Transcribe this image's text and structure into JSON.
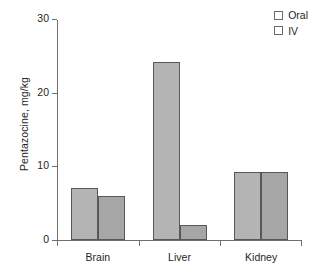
{
  "chart_data": {
    "type": "bar",
    "title": "",
    "subtitle": "",
    "xlabel": "",
    "ylabel": "Pentazocine, mg/kg",
    "categories": [
      "Brain",
      "Liver",
      "Kidney"
    ],
    "series": [
      {
        "name": "Oral",
        "values": [
          7.0,
          24.1,
          9.3
        ],
        "color": "#b4b4b4"
      },
      {
        "name": "IV",
        "values": [
          6.0,
          2.1,
          9.3
        ],
        "color": "#a6a6a6"
      }
    ],
    "ylim": [
      0,
      30
    ],
    "yticks": [
      0,
      10,
      20,
      30
    ],
    "ytick_labels": [
      "0",
      "10",
      "20",
      "30"
    ],
    "grid": false,
    "legend_position": "top-right",
    "annotations": []
  },
  "legend": {
    "entries": [
      {
        "label": "Oral"
      },
      {
        "label": "IV"
      }
    ]
  },
  "axes": {
    "y_title": "Pentazocine, mg/kg",
    "tick_labels": [
      "30",
      "20",
      "10",
      "0"
    ],
    "category_labels": [
      "Brain",
      "Liver",
      "Kidney"
    ]
  }
}
